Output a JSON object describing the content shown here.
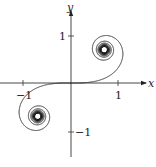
{
  "chart_data": {
    "type": "line",
    "title": "",
    "xlabel": "x",
    "ylabel": "y",
    "xlim": [
      -1.5,
      1.7
    ],
    "ylim": [
      -1.55,
      1.6
    ],
    "xticks": [
      -1,
      1
    ],
    "yticks": [
      1,
      -1
    ],
    "xtick_labels": [
      "−1",
      "1"
    ],
    "ytick_labels": [
      "1",
      "−1"
    ],
    "grid": false,
    "legend": null,
    "series": [
      {
        "name": "Cornu spiral",
        "param": "t",
        "t_range": [
          -7,
          7
        ],
        "limit_points": [
          [
            0.7,
            0.7
          ],
          [
            -0.7,
            -0.7
          ]
        ],
        "color": "#222222"
      }
    ]
  },
  "axes": {
    "x_label": "x",
    "y_label": "y",
    "x_tick_pos": "1",
    "x_tick_neg": "−1",
    "y_tick_pos": "1",
    "y_tick_neg": "−1"
  }
}
